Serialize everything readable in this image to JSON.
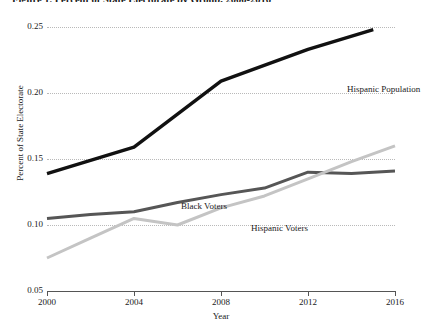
{
  "figure": {
    "title": "Figure 1. Percent of State Electorate by Group, 2000-2016"
  },
  "axes": {
    "y_title": "Percent of State Electorate",
    "x_title": "Year",
    "y_ticks": [
      "0.05",
      "0.10",
      "0.15",
      "0.20",
      "0.25"
    ],
    "x_ticks": [
      "2000",
      "2004",
      "2008",
      "2012",
      "2016"
    ]
  },
  "annotations": {
    "hispanic_population": "Hispanic Population",
    "black_voters": "Black Voters",
    "hispanic_voters": "Hispanic Voters"
  },
  "colors": {
    "hispanic_population": "#111111",
    "black_voters": "#565656",
    "hispanic_voters": "#c4c4c4",
    "gridline": "#b9b9b9",
    "axis": "#555555",
    "background": "#ffffff"
  },
  "chart_data": {
    "type": "line",
    "title": "Figure 1. Percent of State Electorate by Group, 2000-2016",
    "xlabel": "Year",
    "ylabel": "Percent of State Electorate",
    "xlim": [
      2000,
      2016
    ],
    "ylim": [
      0.05,
      0.25
    ],
    "yticks": [
      0.05,
      0.1,
      0.15,
      0.2,
      0.25
    ],
    "xticks": [
      2000,
      2004,
      2008,
      2012,
      2016
    ],
    "grid": "horizontal-dotted",
    "legend": "inline-annotations",
    "series": [
      {
        "name": "Hispanic Population",
        "color": "#111111",
        "x": [
          2000,
          2004,
          2008,
          2012,
          2015
        ],
        "values": [
          0.139,
          0.159,
          0.209,
          0.233,
          0.248
        ]
      },
      {
        "name": "Black Voters",
        "color": "#565656",
        "x": [
          2000,
          2002,
          2004,
          2006,
          2008,
          2010,
          2012,
          2014,
          2016
        ],
        "values": [
          0.105,
          0.108,
          0.11,
          0.117,
          0.123,
          0.128,
          0.14,
          0.139,
          0.141
        ]
      },
      {
        "name": "Hispanic Voters",
        "color": "#c4c4c4",
        "x": [
          2000,
          2002,
          2004,
          2006,
          2008,
          2010,
          2012,
          2014,
          2016
        ],
        "values": [
          0.075,
          0.09,
          0.105,
          0.1,
          0.113,
          0.122,
          0.135,
          0.148,
          0.16
        ]
      }
    ]
  }
}
